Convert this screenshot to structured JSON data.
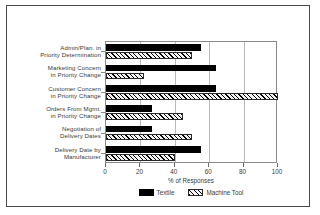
{
  "chart_data": {
    "type": "bar",
    "orientation": "horizontal",
    "title": "",
    "xlabel": "% of Responses",
    "ylabel": "",
    "xlim": [
      0,
      100
    ],
    "xticks": [
      0,
      20,
      40,
      60,
      80,
      100
    ],
    "grid": true,
    "legend_position": "bottom",
    "categories": [
      "Admin/Plan. in Priority Determination",
      "Marketing Concern in Priority Change",
      "Customer Concern in Priority Change",
      "Orders From Mgmt. in Priority Change",
      "Negotiation of Delivery Dates",
      "Delivery Date by Manufacturer"
    ],
    "category_lines": [
      [
        "Admin/Plan. in",
        "Priority Determination"
      ],
      [
        "Marketing Concern",
        "in Priority Change"
      ],
      [
        "Customer Concern",
        "in Priority Change"
      ],
      [
        "Orders From Mgmt.",
        "in Priority Change"
      ],
      [
        "Negotiation of",
        "Delivery Dates"
      ],
      [
        "Delivery Date by",
        "Manufacturer"
      ]
    ],
    "series": [
      {
        "name": "Textile",
        "values": [
          55,
          64,
          64,
          27,
          27,
          55
        ]
      },
      {
        "name": "Machine Tool",
        "values": [
          50,
          22,
          100,
          45,
          50,
          40
        ]
      }
    ]
  },
  "legend": {
    "items": [
      {
        "label": "Textile",
        "pattern": "solid"
      },
      {
        "label": "Machine Tool",
        "pattern": "diagonal-hatch"
      }
    ]
  },
  "colors": {
    "textile": "#000000",
    "machine_tool_hatch": "#000000",
    "frame": "#4a4a4a",
    "axis": "#8a8a8a",
    "grid": "#b9b9b9",
    "text": "#3a3a3a"
  }
}
